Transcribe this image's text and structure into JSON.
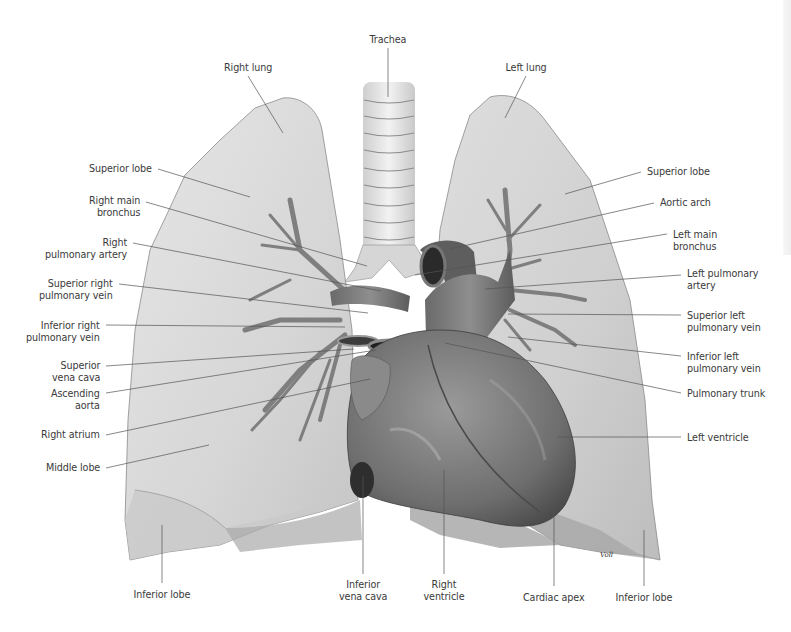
{
  "figure": {
    "colors": {
      "background": "#ffffff",
      "lung_fill": "#dcdcdc",
      "lung_edge": "#8a8a8a",
      "heart_fill": "#7a7a7a",
      "vessel_dark": "#5a5a5a",
      "leader_line": "#555555",
      "label_text": "#3a3a3a"
    },
    "signature": "Voll"
  },
  "labels": {
    "top": [
      {
        "id": "trachea",
        "lines": [
          "Trachea"
        ],
        "x": 388,
        "y": 34,
        "align": "center",
        "target": [
          388,
          97
        ]
      },
      {
        "id": "right-lung",
        "lines": [
          "Right lung"
        ],
        "x": 248,
        "y": 62,
        "align": "center",
        "target": [
          283,
          133
        ]
      },
      {
        "id": "left-lung",
        "lines": [
          "Left lung"
        ],
        "x": 526,
        "y": 62,
        "align": "center",
        "target": [
          505,
          118
        ]
      }
    ],
    "left": [
      {
        "id": "superior-lobe-right",
        "lines": [
          "Superior lobe"
        ],
        "x": 152,
        "y": 163,
        "anchor": [
          158,
          169
        ],
        "target": [
          250,
          197
        ]
      },
      {
        "id": "right-main-bronchus",
        "lines": [
          "Right main",
          "bronchus"
        ],
        "x": 140,
        "y": 195,
        "anchor": [
          146,
          202
        ],
        "target": [
          367,
          266
        ]
      },
      {
        "id": "right-pulmonary-artery",
        "lines": [
          "Right",
          "pulmonary artery"
        ],
        "x": 127,
        "y": 237,
        "anchor": [
          133,
          243
        ],
        "target": [
          381,
          291
        ]
      },
      {
        "id": "superior-right-pulmonary-vein",
        "lines": [
          "Superior right",
          "pulmonary vein"
        ],
        "x": 113,
        "y": 278,
        "anchor": [
          119,
          284
        ],
        "target": [
          368,
          313
        ]
      },
      {
        "id": "inferior-right-pulmonary-vein",
        "lines": [
          "Inferior right",
          "pulmonary vein"
        ],
        "x": 100,
        "y": 320,
        "anchor": [
          106,
          325
        ],
        "target": [
          345,
          327
        ]
      },
      {
        "id": "superior-vena-cava",
        "lines": [
          "Superior",
          "vena cava"
        ],
        "x": 100,
        "y": 360,
        "anchor": [
          106,
          366
        ],
        "target": [
          354,
          349
        ]
      },
      {
        "id": "ascending-aorta",
        "lines": [
          "Ascending",
          "aorta"
        ],
        "x": 100,
        "y": 388,
        "anchor": [
          106,
          393
        ],
        "target": [
          376,
          350
        ]
      },
      {
        "id": "right-atrium",
        "lines": [
          "Right atrium"
        ],
        "x": 100,
        "y": 429,
        "anchor": [
          106,
          435
        ],
        "target": [
          370,
          379
        ]
      },
      {
        "id": "middle-lobe",
        "lines": [
          "Middle lobe"
        ],
        "x": 100,
        "y": 462,
        "anchor": [
          106,
          468
        ],
        "target": [
          209,
          445
        ]
      },
      {
        "id": "inferior-lobe-right",
        "lines": [
          "Inferior lobe"
        ],
        "x": 162,
        "y": 589,
        "align": "center",
        "anchor": [
          162,
          583
        ],
        "target": [
          162,
          525
        ]
      }
    ],
    "right": [
      {
        "id": "superior-lobe-left",
        "lines": [
          "Superior lobe"
        ],
        "x": 647,
        "y": 166,
        "anchor": [
          641,
          172
        ],
        "target": [
          565,
          194
        ]
      },
      {
        "id": "aortic-arch",
        "lines": [
          "Aortic arch"
        ],
        "x": 660,
        "y": 197,
        "anchor": [
          654,
          203
        ],
        "target": [
          450,
          249
        ]
      },
      {
        "id": "left-main-bronchus",
        "lines": [
          "Left main",
          "bronchus"
        ],
        "x": 673,
        "y": 229,
        "anchor": [
          667,
          234
        ],
        "target": [
          415,
          275
        ]
      },
      {
        "id": "left-pulmonary-artery",
        "lines": [
          "Left pulmonary",
          "artery"
        ],
        "x": 687,
        "y": 268,
        "anchor": [
          681,
          275
        ],
        "target": [
          485,
          289
        ]
      },
      {
        "id": "superior-left-pulmonary-vein",
        "lines": [
          "Superior left",
          "pulmonary vein"
        ],
        "x": 687,
        "y": 310,
        "anchor": [
          681,
          315
        ],
        "target": [
          508,
          314
        ]
      },
      {
        "id": "inferior-left-pulmonary-vein",
        "lines": [
          "Inferior left",
          "pulmonary vein"
        ],
        "x": 687,
        "y": 351,
        "anchor": [
          681,
          356
        ],
        "target": [
          508,
          337
        ]
      },
      {
        "id": "pulmonary-trunk",
        "lines": [
          "Pulmonary trunk"
        ],
        "x": 687,
        "y": 388,
        "anchor": [
          681,
          393
        ],
        "target": [
          445,
          343
        ]
      },
      {
        "id": "left-ventricle",
        "lines": [
          "Left ventricle"
        ],
        "x": 687,
        "y": 432,
        "anchor": [
          681,
          437
        ],
        "target": [
          558,
          437
        ]
      }
    ],
    "bottom": [
      {
        "id": "inferior-vena-cava",
        "lines": [
          "Inferior",
          "vena cava"
        ],
        "x": 363,
        "y": 579,
        "align": "center",
        "anchor": [
          363,
          574
        ],
        "target": [
          363,
          476
        ]
      },
      {
        "id": "right-ventricle",
        "lines": [
          "Right",
          "ventricle"
        ],
        "x": 444,
        "y": 579,
        "align": "center",
        "anchor": [
          444,
          574
        ],
        "target": [
          444,
          470
        ]
      },
      {
        "id": "cardiac-apex",
        "lines": [
          "Cardiac apex"
        ],
        "x": 554,
        "y": 592,
        "align": "center",
        "anchor": [
          554,
          586
        ],
        "target": [
          554,
          510
        ]
      },
      {
        "id": "inferior-lobe-left",
        "lines": [
          "Inferior lobe"
        ],
        "x": 644,
        "y": 592,
        "align": "center",
        "anchor": [
          644,
          586
        ],
        "target": [
          644,
          530
        ]
      }
    ]
  }
}
